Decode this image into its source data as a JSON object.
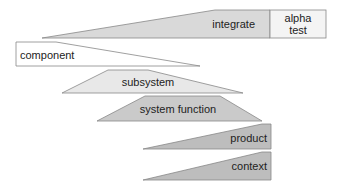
{
  "diagram": {
    "shapes": [
      {
        "id": "integrate",
        "label": "integrate",
        "fill": "#d9d9d9"
      },
      {
        "id": "alpha-test",
        "label_line1": "alpha",
        "label_line2": "test",
        "fill": "#f4f4f4"
      },
      {
        "id": "component",
        "label": "component",
        "fill": "#ffffff"
      },
      {
        "id": "subsystem",
        "label": "subsystem",
        "fill": "#e8e8e8"
      },
      {
        "id": "system-function",
        "label": "system function",
        "fill": "#cacaca"
      },
      {
        "id": "product",
        "label": "product",
        "fill": "#bdbdbd"
      },
      {
        "id": "context",
        "label": "context",
        "fill": "#bdbdbd"
      }
    ]
  }
}
